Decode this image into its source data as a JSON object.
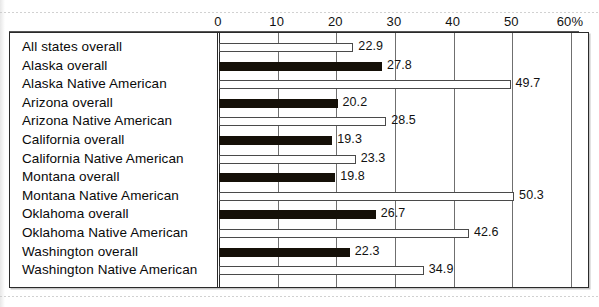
{
  "chart_data": {
    "type": "bar",
    "orientation": "horizontal",
    "title": "",
    "xlabel": "",
    "ylabel": "",
    "xlim": [
      0,
      60
    ],
    "xticks": [
      0,
      10,
      20,
      30,
      40,
      50,
      60
    ],
    "xtick_labels": [
      "0",
      "10",
      "20",
      "30",
      "40",
      "50",
      "60%"
    ],
    "grid": true,
    "legend": "none",
    "categories": [
      "All states overall",
      "Alaska overall",
      "Alaska Native American",
      "Arizona overall",
      "Arizona Native American",
      "California overall",
      "California Native American",
      "Montana overall",
      "Montana Native American",
      "Oklahoma overall",
      "Oklahoma Native American",
      "Washington overall",
      "Washington Native American"
    ],
    "values": [
      22.9,
      27.8,
      49.7,
      20.2,
      28.5,
      19.3,
      23.3,
      19.8,
      50.3,
      26.7,
      42.6,
      22.3,
      34.9
    ],
    "bar_styles": [
      "hollow",
      "solid",
      "hollow",
      "solid",
      "hollow",
      "solid",
      "hollow",
      "solid",
      "hollow",
      "solid",
      "hollow",
      "solid",
      "hollow"
    ],
    "value_labels": [
      "22.9",
      "27.8",
      "49.7",
      "20.2",
      "28.5",
      "19.3",
      "23.3",
      "19.8",
      "50.3",
      "26.7",
      "42.6",
      "22.3",
      "34.9"
    ],
    "colors": {
      "solid_fill": "#151008",
      "hollow_fill": "#ffffff",
      "bar_outline": "#4a4a4a",
      "gridline": "#6f6f6f",
      "axis": "#2a2a2a",
      "text": "#0a0a0a",
      "background": "#ffffff"
    }
  }
}
